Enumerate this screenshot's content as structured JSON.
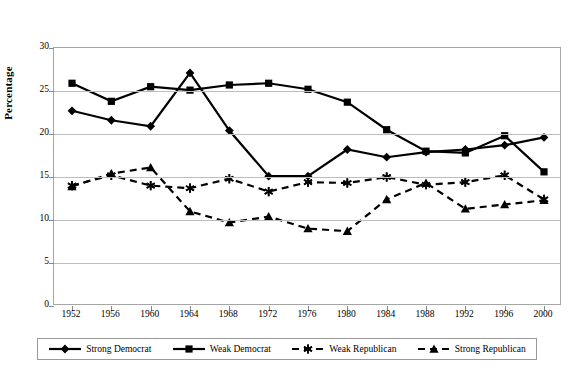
{
  "top_caption": "",
  "axis": {
    "ylabel": "Percentage",
    "yticks": [
      0,
      5,
      10,
      15,
      20,
      25,
      30
    ],
    "ymin": 0,
    "ymax": 30
  },
  "legend": {
    "items": [
      {
        "label": "Strong Democrat",
        "marker": "diamond",
        "dash": "solid",
        "color": "#000000"
      },
      {
        "label": "Weak Democrat",
        "marker": "square",
        "dash": "solid",
        "color": "#000000"
      },
      {
        "label": "Weak Republican",
        "marker": "asterisk",
        "dash": "dashed",
        "color": "#000000"
      },
      {
        "label": "Strong Republican",
        "marker": "triangle",
        "dash": "dashed",
        "color": "#000000"
      }
    ]
  },
  "chart_data": {
    "type": "line",
    "title": "",
    "xlabel": "",
    "ylabel": "Percentage",
    "ylim": [
      0,
      30
    ],
    "yticks": [
      0,
      5,
      10,
      15,
      20,
      25,
      30
    ],
    "grid": true,
    "legend_position": "bottom",
    "categories": [
      1952,
      1956,
      1960,
      1964,
      1968,
      1972,
      1976,
      1980,
      1984,
      1988,
      1992,
      1996,
      2000
    ],
    "series": [
      {
        "name": "Strong Democrat",
        "marker": "diamond",
        "dash": "solid",
        "values": [
          22.7,
          21.6,
          20.9,
          27.1,
          20.4,
          15.1,
          15.1,
          18.2,
          17.3,
          17.9,
          18.2,
          18.7,
          19.6
        ]
      },
      {
        "name": "Weak Democrat",
        "marker": "square",
        "dash": "solid",
        "values": [
          25.9,
          23.8,
          25.5,
          25.1,
          25.7,
          25.9,
          25.2,
          23.7,
          20.5,
          18.0,
          17.8,
          19.8,
          15.6
        ]
      },
      {
        "name": "Weak Republican",
        "marker": "asterisk",
        "dash": "dashed",
        "values": [
          14.0,
          15.2,
          14.0,
          13.7,
          14.8,
          13.3,
          14.4,
          14.3,
          15.0,
          14.1,
          14.4,
          15.2,
          12.4
        ]
      },
      {
        "name": "Strong Republican",
        "marker": "triangle",
        "dash": "dashed",
        "values": [
          13.9,
          15.4,
          16.1,
          11.0,
          9.7,
          10.4,
          9.0,
          8.7,
          12.4,
          14.3,
          11.3,
          11.8,
          12.3
        ]
      }
    ]
  }
}
